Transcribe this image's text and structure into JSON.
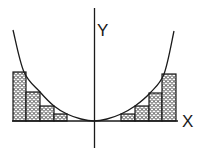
{
  "diagram": {
    "axes": {
      "x_label": "X",
      "y_label": "Y"
    },
    "colors": {
      "stroke": "#1a1a1a",
      "background": "#ffffff",
      "fill_pattern": "scale"
    },
    "curve": {
      "points": [
        [
          13,
          30
        ],
        [
          24,
          72
        ],
        [
          40,
          92
        ],
        [
          54,
          106
        ],
        [
          67,
          114
        ],
        [
          81,
          119
        ],
        [
          94,
          121
        ],
        [
          107,
          119
        ],
        [
          121,
          114
        ],
        [
          135,
          106
        ],
        [
          150,
          93
        ],
        [
          164,
          74
        ],
        [
          174,
          31
        ]
      ]
    },
    "left_bars": [
      {
        "x": 13,
        "width": 13,
        "top": 72
      },
      {
        "x": 26,
        "width": 14,
        "top": 92
      },
      {
        "x": 40,
        "width": 14,
        "top": 106
      },
      {
        "x": 54,
        "width": 13,
        "top": 114
      }
    ],
    "right_bars": [
      {
        "x": 121,
        "width": 14,
        "top": 114
      },
      {
        "x": 135,
        "width": 14,
        "top": 106
      },
      {
        "x": 149,
        "width": 13,
        "top": 93
      },
      {
        "x": 162,
        "width": 14,
        "top": 74
      }
    ],
    "baseline_y": 121
  }
}
